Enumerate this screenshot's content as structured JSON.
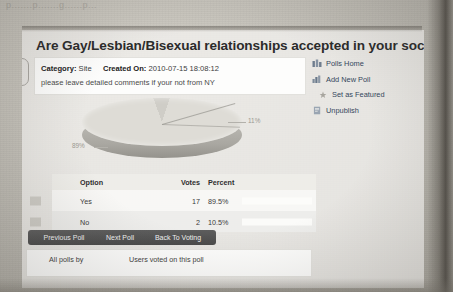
{
  "scan": {
    "top_crumb_text": "p.......p.......g......p..."
  },
  "poll": {
    "title": "Are Gay/Lesbian/Bisexual relationships accepted in your society?",
    "meta": {
      "category_label": "Category:",
      "category_value": "Site",
      "created_label": "Created On:",
      "created_value": "2010-07-15 18:08:12"
    },
    "description": "please leave detailed comments if your not from NY"
  },
  "side_menu": {
    "items": [
      {
        "label": "Polls Home",
        "icon": "polls-home-icon",
        "indent": false
      },
      {
        "label": "Add New Poll",
        "icon": "add-new-poll-icon",
        "indent": false
      },
      {
        "label": "Set as Featured",
        "icon": "star-icon",
        "indent": true
      },
      {
        "label": "Unpublish",
        "icon": "unpublish-icon",
        "indent": false
      }
    ]
  },
  "chart_data": {
    "type": "pie",
    "title": "",
    "categories": [
      "Yes",
      "No"
    ],
    "values": [
      89.5,
      10.5
    ],
    "labels": [
      "89%",
      "11%"
    ],
    "legend": "none",
    "colors": [
      "#dedcd6",
      "#cfcdc7"
    ]
  },
  "results_table": {
    "columns": [
      "Option",
      "Votes",
      "Percent"
    ],
    "rows": [
      {
        "option": "Yes",
        "votes": "17",
        "percent": "89.5%",
        "bar_pct": 89.5
      },
      {
        "option": "No",
        "votes": "2",
        "percent": "10.5%",
        "bar_pct": 10.5
      }
    ]
  },
  "actions": {
    "buttons": [
      {
        "label": "Previous Poll"
      },
      {
        "label": "Next Poll"
      },
      {
        "label": "Back To Voting"
      }
    ]
  },
  "bottom_tabs": {
    "items": [
      {
        "label": "All polls by"
      },
      {
        "label": "Users voted on this poll"
      }
    ]
  },
  "colors": {
    "paper": "#bdbab2",
    "sheet": "#f3f2ef",
    "button": "#4a4a4a",
    "link": "#33465c",
    "bar": "#c3c6cb"
  }
}
